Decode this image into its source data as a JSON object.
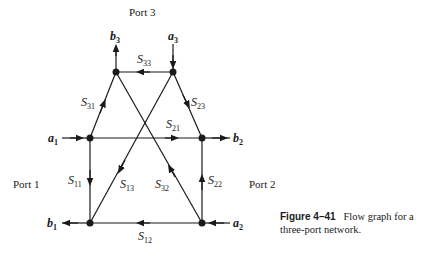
{
  "figure": {
    "caption_label": "Figure 4–41",
    "caption_text": "Flow graph for a three-port network."
  },
  "ports": {
    "port1": "Port 1",
    "port2": "Port 2",
    "port3": "Port 3"
  },
  "variables": {
    "a1": {
      "base": "a",
      "sub": "1"
    },
    "b1": {
      "base": "b",
      "sub": "1"
    },
    "a2": {
      "base": "a",
      "sub": "2"
    },
    "b2": {
      "base": "b",
      "sub": "2"
    },
    "a3": {
      "base": "a",
      "sub": "3"
    },
    "b3": {
      "base": "b",
      "sub": "3"
    }
  },
  "branches": {
    "S11": {
      "base": "S",
      "sub": "11"
    },
    "S12": {
      "base": "S",
      "sub": "12"
    },
    "S13": {
      "base": "S",
      "sub": "13"
    },
    "S21": {
      "base": "S",
      "sub": "21"
    },
    "S22": {
      "base": "S",
      "sub": "22"
    },
    "S23": {
      "base": "S",
      "sub": "23"
    },
    "S31": {
      "base": "S",
      "sub": "31"
    },
    "S32": {
      "base": "S",
      "sub": "32"
    },
    "S33": {
      "base": "S",
      "sub": "33"
    }
  },
  "colors": {
    "ink": "#1a1a1a",
    "background": "#ffffff"
  }
}
